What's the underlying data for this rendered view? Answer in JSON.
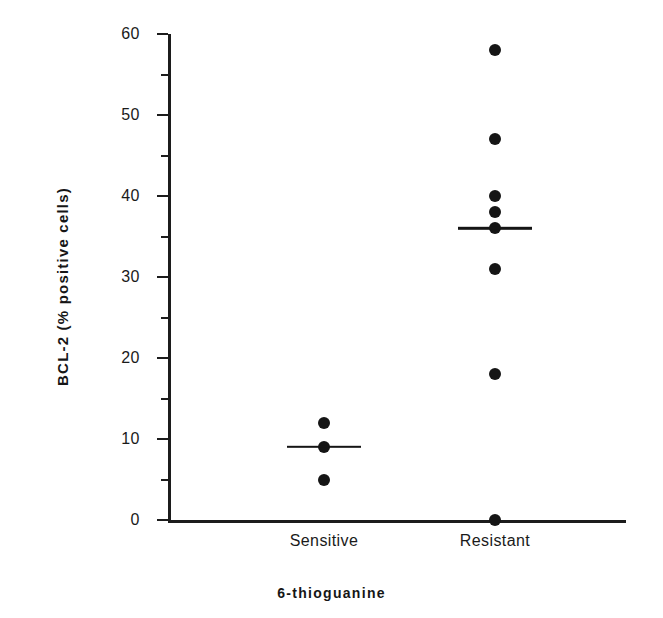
{
  "chart_data": {
    "type": "scatter",
    "title": "",
    "xlabel": "6-thioguanine",
    "ylabel": "BCL-2 (% positive cells)",
    "ylim": [
      0,
      60
    ],
    "ytick_major_step": 10,
    "ytick_minor_step": 5,
    "ytick_labels": [
      "0",
      "10",
      "20",
      "30",
      "40",
      "50",
      "60"
    ],
    "ytick_values": [
      0,
      10,
      20,
      30,
      40,
      50,
      60
    ],
    "yminor_values": [
      5,
      15,
      25,
      35,
      45,
      55
    ],
    "grid": false,
    "legend": "none",
    "categories": [
      "Sensitive",
      "Resistant"
    ],
    "groups": [
      {
        "name": "Sensitive",
        "values": [
          12,
          9,
          5
        ],
        "median": 9,
        "n": 3
      },
      {
        "name": "Resistant",
        "values": [
          58,
          47,
          40,
          38,
          36,
          31,
          18,
          0
        ],
        "median": 36,
        "n": 8
      }
    ],
    "marker": "filled-circle",
    "marker_color": "#151515",
    "median_bar_color": "#151515",
    "axis_color": "#1c1c1c"
  }
}
